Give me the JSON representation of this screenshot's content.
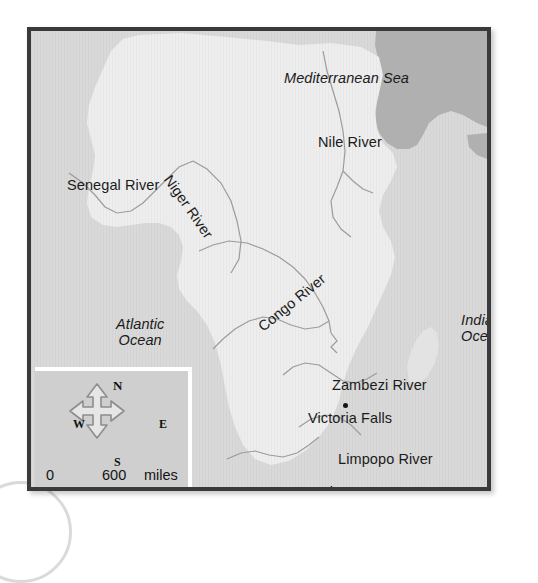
{
  "map": {
    "title": "Map of Africa — Major Rivers",
    "frame_border_color": "#3a3a3c",
    "ocean_color": "#d9d9d9",
    "land_color": "#eeeeee",
    "far_land_color": "#b3b3b3",
    "river_line_color": "#9a9a9a",
    "water_labels": [
      {
        "name": "mediterranean-sea",
        "text": "Mediterranean Sea"
      },
      {
        "name": "atlantic-ocean",
        "line1": "Atlantic",
        "line2": "Ocean"
      },
      {
        "name": "indian-ocean",
        "line1": "Indian",
        "line2": "Ocean"
      }
    ],
    "river_labels": [
      {
        "name": "nile-river",
        "text": "Nile River"
      },
      {
        "name": "senegal-river",
        "text": "Senegal River"
      },
      {
        "name": "niger-river",
        "text": "Niger River"
      },
      {
        "name": "congo-river",
        "text": "Congo River"
      },
      {
        "name": "zambezi-river",
        "text": "Zambezi River"
      },
      {
        "name": "limpopo-river",
        "text": "Limpopo River"
      },
      {
        "name": "orange-river",
        "text": "Orange River"
      }
    ],
    "places": [
      {
        "name": "victoria-falls",
        "text": "Victoria Falls",
        "marker": "dot"
      }
    ]
  },
  "legend": {
    "compass": {
      "north": "N",
      "south": "S",
      "east": "E",
      "west": "W"
    },
    "scale": {
      "miles": {
        "zero": "0",
        "value": "600",
        "unit": "miles"
      },
      "km": {
        "zero": "0",
        "value": "965",
        "unit": "km"
      }
    }
  }
}
